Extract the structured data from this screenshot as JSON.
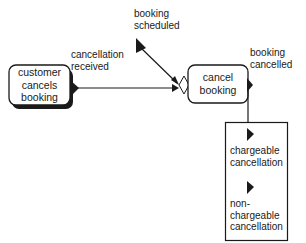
{
  "diagram": {
    "type": "process-event-diagram",
    "nodes": [
      {
        "id": "customer",
        "label": "customer\ncancels\nbooking",
        "kind": "external-process"
      },
      {
        "id": "cancel",
        "label": "cancel\nbooking",
        "kind": "process"
      }
    ],
    "events": {
      "cancellation_received": "cancellation\nreceived",
      "booking_scheduled": "booking\nscheduled",
      "booking_cancelled": "booking\ncancelled"
    },
    "outcomes_box": {
      "items": [
        {
          "label": "chargeable\ncancellation"
        },
        {
          "label": "non-\nchargeable\ncancellation"
        }
      ]
    },
    "edges": [
      {
        "from": "customer",
        "to": "cancel",
        "label": "cancellation received"
      },
      {
        "from": "booking scheduled",
        "to": "cancel",
        "label": "booking scheduled"
      },
      {
        "from": "cancel",
        "to": "outcomes",
        "label": "booking cancelled"
      }
    ],
    "colors": {
      "stroke": "#1a1a1a",
      "fill": "#ffffff"
    }
  }
}
